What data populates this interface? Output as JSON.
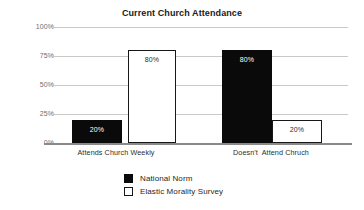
{
  "chart_data": {
    "type": "bar",
    "title": "Current Church Attendance",
    "xlabel": "",
    "ylabel": "",
    "categories": [
      "Attends Church Weekly",
      "Doesn't  Attend Chruch"
    ],
    "series": [
      {
        "name": "National Norm",
        "values": [
          20,
          80
        ],
        "color": "#0a0a0a",
        "style": "filled"
      },
      {
        "name": "Elastic Morality Survey",
        "values": [
          80,
          20
        ],
        "color": "#ffffff",
        "style": "hollow"
      }
    ],
    "bars": [
      {
        "category": "Attends Church Weekly",
        "series": "National Norm",
        "value": 20,
        "label": "20%",
        "style": "filled"
      },
      {
        "category": "Attends Church Weekly",
        "series": "Elastic Morality Survey",
        "value": 80,
        "label": "80%",
        "style": "hollow"
      },
      {
        "category": "Doesn't  Attend Chruch",
        "series": "National Norm",
        "value": 80,
        "label": "80%",
        "style": "filled"
      },
      {
        "category": "Doesn't  Attend Chruch",
        "series": "Elastic Morality Survey",
        "value": 20,
        "label": "20%",
        "style": "hollow"
      }
    ],
    "ylim": [
      0,
      100
    ],
    "yticks": [
      0,
      25,
      50,
      75,
      100
    ],
    "ytick_labels": [
      "0%",
      "25%",
      "50%",
      "75%",
      "100%"
    ],
    "grid": true,
    "grid_color": "#c9c9c9",
    "legend_position": "bottom-center",
    "background": "#ffffff"
  },
  "axis": {
    "ytick_100": "100%",
    "ytick_75": "75%",
    "ytick_50": "50%",
    "ytick_25": "25%",
    "ytick_0": "0%",
    "xcat_0": "Attends Church Weekly",
    "xcat_1": "Doesn't  Attend Chruch"
  },
  "bar_labels": {
    "b0": "20%",
    "b1": "80%",
    "b2": "80%",
    "b3": "20%"
  },
  "legend": {
    "national_norm": "National Norm",
    "elastic_morality_survey": "Elastic Morality Survey"
  }
}
